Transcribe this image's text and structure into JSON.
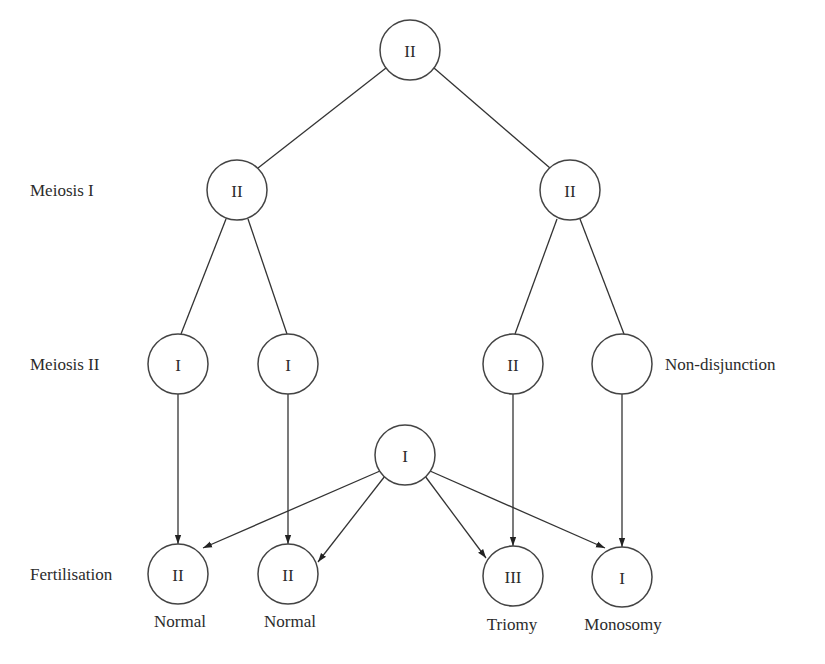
{
  "diagram": {
    "stages": [
      {
        "label": "Meiosis I",
        "y": 196
      },
      {
        "label": "Meiosis II",
        "y": 370
      },
      {
        "label": "Fertilisation",
        "y": 580
      }
    ],
    "nodes": [
      {
        "id": "parent",
        "label": "II",
        "x": 410,
        "y": 50
      },
      {
        "id": "m1a",
        "label": "II",
        "x": 237,
        "y": 190
      },
      {
        "id": "m1b",
        "label": "II",
        "x": 570,
        "y": 190
      },
      {
        "id": "m2a",
        "label": "I",
        "x": 178,
        "y": 364
      },
      {
        "id": "m2b",
        "label": "I",
        "x": 288,
        "y": 364
      },
      {
        "id": "m2c",
        "label": "II",
        "x": 513,
        "y": 364
      },
      {
        "id": "m2d",
        "label": "",
        "x": 622,
        "y": 364
      },
      {
        "id": "gamete",
        "label": "I",
        "x": 405,
        "y": 455
      },
      {
        "id": "f1",
        "label": "II",
        "x": 178,
        "y": 574
      },
      {
        "id": "f2",
        "label": "II",
        "x": 288,
        "y": 574
      },
      {
        "id": "f3",
        "label": "III",
        "x": 513,
        "y": 576
      },
      {
        "id": "f4",
        "label": "I",
        "x": 622,
        "y": 577
      }
    ],
    "annotation": "Non-disjunction",
    "outcomes": [
      "Normal",
      "Normal",
      "Triomy",
      "Monosomy"
    ]
  }
}
